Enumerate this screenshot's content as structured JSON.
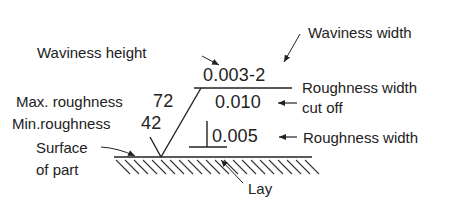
{
  "diagram": {
    "colors": {
      "ink": "#222222",
      "background": "#ffffff"
    },
    "symbol_values": {
      "waviness_value": "0.003-2",
      "cutoff_value": "0.010",
      "roughness_width_value": "0.005",
      "max_roughness_value": "72",
      "min_roughness_value": "42"
    },
    "labels": {
      "waviness_height": "Waviness height",
      "waviness_width": "Waviness width",
      "roughness_width_cutoff_line1": "Roughness width",
      "roughness_width_cutoff_line2": "cut off",
      "roughness_width": "Roughness width",
      "max_roughness": "Max. roughness",
      "min_roughness": "Min.roughness",
      "surface_line1": "Surface",
      "surface_line2": "of part",
      "lay": "Lay"
    }
  }
}
